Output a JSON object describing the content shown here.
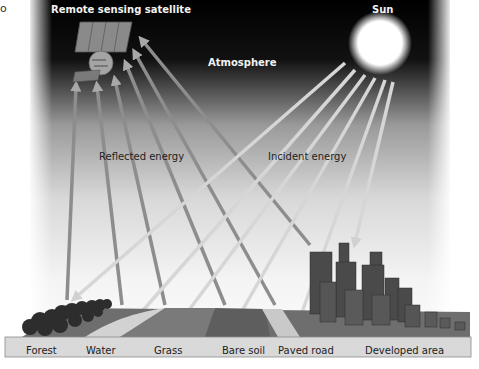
{
  "corner_mark": "o",
  "labels": {
    "satellite": "Remote sensing satellite",
    "sun": "Sun",
    "atmosphere": "Atmosphere",
    "reflected": "Reflected energy",
    "incident": "Incident energy"
  },
  "ground_labels": [
    "Forest",
    "Water",
    "Grass",
    "Bare soil",
    "Paved road",
    "Developed area"
  ],
  "colors": {
    "sky_top": "#000000",
    "sky_bottom": "#e6e6e6",
    "ray": "#c8c8c8",
    "ground_surface": "#6e6e6e",
    "ground_front": "#d9d9d9",
    "buildings": "#4a4a4a"
  }
}
